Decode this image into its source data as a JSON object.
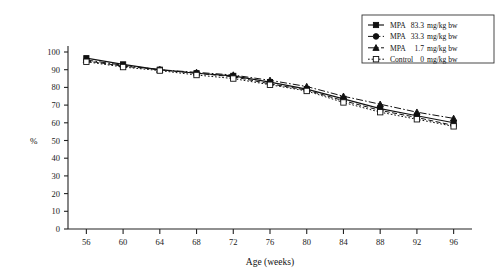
{
  "chart_data": {
    "type": "line",
    "title": "",
    "xlabel": "Age (weeks)",
    "ylabel": "%",
    "x": [
      56,
      60,
      64,
      68,
      72,
      76,
      80,
      84,
      88,
      92,
      96
    ],
    "xlim": [
      54,
      98
    ],
    "ylim": [
      0,
      100
    ],
    "xticks": [
      56,
      60,
      64,
      68,
      72,
      76,
      80,
      84,
      88,
      92,
      96
    ],
    "yticks": [
      0,
      10,
      20,
      30,
      40,
      50,
      60,
      70,
      80,
      90,
      100
    ],
    "grid": false,
    "legend_position": "top-right",
    "series": [
      {
        "name": "MPA   83.3 mg/kg bw",
        "dose_label": "83.3 mg/kg bw",
        "treatment": "MPA",
        "marker": "filled-square",
        "linestyle": "solid",
        "values": [
          96.5,
          93.0,
          90.0,
          88.0,
          86.5,
          83.0,
          79.0,
          73.5,
          68.0,
          64.0,
          60.0
        ]
      },
      {
        "name": "MPA   33.3 mg/kg bw",
        "dose_label": "33.3 mg/kg bw",
        "treatment": "MPA",
        "marker": "filled-circle",
        "linestyle": "dashed",
        "values": [
          95.0,
          92.0,
          90.0,
          88.0,
          86.0,
          82.0,
          78.5,
          72.5,
          67.0,
          63.0,
          58.5
        ]
      },
      {
        "name": "MPA    1.7 mg/kg bw",
        "dose_label": "1.7 mg/kg bw",
        "treatment": "MPA",
        "marker": "filled-triangle",
        "linestyle": "dash-dot",
        "values": [
          95.5,
          92.5,
          90.0,
          88.5,
          87.0,
          84.0,
          80.5,
          75.0,
          70.5,
          66.0,
          62.5
        ]
      },
      {
        "name": "Control   0 mg/kg bw",
        "dose_label": "0 mg/kg bw",
        "treatment": "Control",
        "marker": "open-square",
        "linestyle": "dotted",
        "values": [
          94.5,
          91.5,
          89.5,
          87.0,
          85.0,
          81.5,
          78.0,
          71.5,
          66.0,
          62.0,
          58.0
        ]
      }
    ]
  },
  "legend": {
    "entries": [
      {
        "label_treatment": "MPA",
        "label_dose": "83.3 mg/kg bw"
      },
      {
        "label_treatment": "MPA",
        "label_dose": "33.3 mg/kg bw"
      },
      {
        "label_treatment": "MPA",
        "label_dose": "1.7 mg/kg bw"
      },
      {
        "label_treatment": "Control",
        "label_dose": "0 mg/kg bw"
      }
    ]
  },
  "axes": {
    "y_title": "%",
    "x_title": "Age (weeks)",
    "y_ticklabels": [
      "0",
      "10",
      "20",
      "30",
      "40",
      "50",
      "60",
      "70",
      "80",
      "90",
      "100"
    ],
    "x_ticklabels": [
      "56",
      "60",
      "64",
      "68",
      "72",
      "76",
      "80",
      "84",
      "88",
      "92",
      "96"
    ]
  }
}
